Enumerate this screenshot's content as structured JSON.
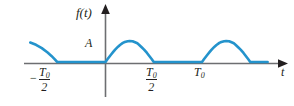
{
  "figure": {
    "name": "half-wave-rectified-sine-waveform",
    "axes": {
      "y_axis_label": "f(t)",
      "x_axis_label": "t",
      "amplitude_label": "A"
    },
    "tick_labels": [
      {
        "id": "neg-half-period",
        "minus": "−",
        "numerator": "T",
        "subscript": "0",
        "denominator": "2",
        "value": -0.5
      },
      {
        "id": "pos-half-period",
        "minus": "",
        "numerator": "T",
        "subscript": "0",
        "denominator": "2",
        "value": 0.5
      },
      {
        "id": "one-period",
        "text": "T",
        "subscript": "0",
        "value": 1.0
      }
    ],
    "colors": {
      "curve": "#2493cc",
      "curve_highlight": "#7fc6e4",
      "axis": "#6d6e71",
      "text": "#231f20",
      "background": "#ffffff"
    }
  },
  "chart_data": {
    "type": "line",
    "title": "",
    "subtitle": "",
    "xlabel": "t",
    "ylabel": "f(t)",
    "xlim": [
      -0.78,
      1.72
    ],
    "ylim": [
      0,
      1.18
    ],
    "grid": false,
    "legend": null,
    "annotations": [
      {
        "text": "A",
        "x": 0,
        "y": 1.0,
        "note": "peak amplitude marker on y-axis"
      },
      {
        "text": "−T₀/2",
        "x": -0.5,
        "y": 0
      },
      {
        "text": "T₀/2",
        "x": 0.5,
        "y": 0
      },
      {
        "text": "T₀",
        "x": 1.0,
        "y": 0
      },
      {
        "text": "t",
        "x": 1.72,
        "y": 0
      },
      {
        "text": "f(t)",
        "x": 0,
        "y": 1.18
      }
    ],
    "function": "A*sin(2*pi*t/T0) on [0, T0/2]; 0 on [T0/2, T0]",
    "amplitude": 1.0,
    "period": 1.0,
    "series": [
      {
        "name": "f(t)",
        "x": [
          -0.78,
          -0.72,
          -0.66,
          -0.6,
          -0.56,
          -0.53,
          -0.5,
          -0.45,
          -0.3,
          -0.15,
          0.0,
          0.02,
          0.05,
          0.08,
          0.1,
          0.13,
          0.15,
          0.18,
          0.2,
          0.23,
          0.25,
          0.28,
          0.3,
          0.33,
          0.35,
          0.38,
          0.4,
          0.43,
          0.45,
          0.48,
          0.5,
          0.55,
          0.7,
          0.85,
          1.0,
          1.02,
          1.05,
          1.08,
          1.1,
          1.13,
          1.15,
          1.18,
          1.2,
          1.23,
          1.25,
          1.28,
          1.3,
          1.33,
          1.35,
          1.38,
          1.4,
          1.43,
          1.45,
          1.48,
          1.5,
          1.55,
          1.62,
          1.68
        ],
        "y": [
          0.93,
          0.82,
          0.66,
          0.45,
          0.29,
          0.15,
          0.0,
          0.0,
          0.0,
          0.0,
          0.0,
          0.13,
          0.31,
          0.48,
          0.59,
          0.73,
          0.81,
          0.91,
          0.95,
          0.99,
          1.0,
          0.99,
          0.95,
          0.89,
          0.81,
          0.68,
          0.59,
          0.43,
          0.31,
          0.13,
          0.0,
          0.0,
          0.0,
          0.0,
          0.0,
          0.13,
          0.31,
          0.48,
          0.59,
          0.73,
          0.81,
          0.91,
          0.95,
          0.99,
          1.0,
          0.99,
          0.95,
          0.89,
          0.81,
          0.68,
          0.59,
          0.43,
          0.31,
          0.13,
          0.0,
          0.0,
          0.0,
          0.0
        ]
      }
    ],
    "x_ticks": [
      -0.5,
      0.5,
      1.0
    ],
    "x_tick_labels": [
      "−T₀/2",
      "T₀/2",
      "T₀"
    ],
    "y_ticks": [
      1.0
    ],
    "y_tick_labels": [
      "A"
    ]
  }
}
